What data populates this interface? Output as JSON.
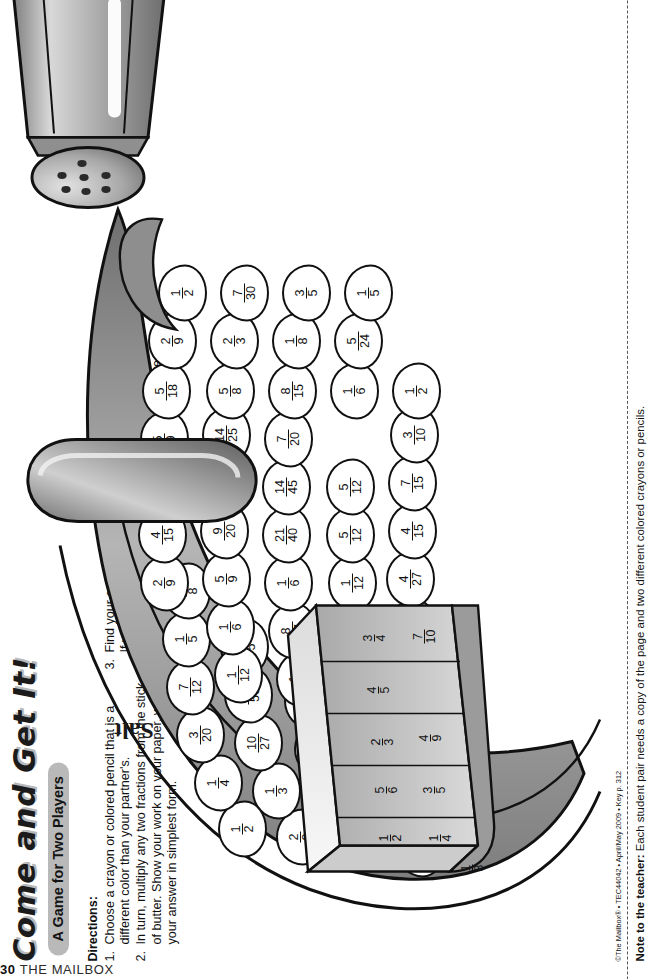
{
  "header": {
    "title": "Come and Get It!",
    "subtitle": "A Game for Two Players"
  },
  "directions": {
    "heading": "Directions:",
    "items": [
      {
        "num": "1.",
        "text": "Choose a crayon or colored pencil that is a different color than your partner's."
      },
      {
        "num": "2.",
        "text": "In turn, multiply any two fractions from the stick of butter. Show your work on your paper, writing your answer in simplest form."
      },
      {
        "num": "3.",
        "text": "Find your answer on the corn cob and color its kernel. If your answer is not on the corn cob or the kernel has already been colored, your turn is over."
      },
      {
        "num": "4.",
        "text": "Play for a set amount of time or until all kernels have been colored. The player with more colored kernels wins."
      }
    ]
  },
  "butter": {
    "label_icon": "butter-stick",
    "fractions": [
      "1/3",
      "1/4",
      "1/2",
      "3/5",
      "5/6",
      "2/3",
      "4/9",
      "4/5",
      "3/4",
      "7/10"
    ]
  },
  "salt": {
    "label": "Salt"
  },
  "corn": {
    "rows": [
      [
        "1/5",
        "3/20",
        "2/9",
        "1/2",
        "2/9",
        "4/15",
        "5/18",
        "2/9",
        "1/2"
      ],
      [
        "3/8",
        "7/12",
        "1/3",
        "1/4",
        "1/3",
        "16/45",
        "5/8",
        "2/3",
        "7/30"
      ],
      [
        "1/4",
        "1/9",
        "10/27",
        "3/20",
        "7/40",
        "1/12",
        "8/27",
        "5/9",
        "1/6"
      ],
      [
        "",
        "3/16",
        "21/50",
        "7/12",
        "2/5",
        "5/12",
        "1/12",
        "1/6",
        "3/5"
      ],
      [
        "",
        "",
        "2/5",
        "1/5",
        "4/27",
        "5/12",
        "21/40",
        "1/6",
        "1/8"
      ],
      [
        "",
        "",
        "",
        "3/8",
        "4/15",
        "7/15",
        "14/45",
        "9/20",
        "8/15"
      ],
      [
        "",
        "",
        "",
        "",
        "",
        "3/10",
        "7/20",
        "12/25",
        "1/6"
      ],
      [
        "",
        "",
        "",
        "",
        "",
        "",
        "",
        "14/25",
        "1/2"
      ],
      [
        "",
        "",
        "",
        "",
        "",
        "",
        "",
        "",
        "5/24"
      ],
      [
        "",
        "",
        "",
        "",
        "",
        "",
        "",
        "",
        "1/5"
      ]
    ],
    "kernel_values": [
      "1/5",
      "3/8",
      "1/4",
      "3/20",
      "7/12",
      "1/9",
      "3/16",
      "2/9",
      "1/3",
      "10/27",
      "21/50",
      "2/5",
      "1/2",
      "1/4",
      "3/20",
      "7/12",
      "1/5",
      "3/8",
      "2/9",
      "1/3",
      "7/40",
      "2/5",
      "4/27",
      "4/15",
      "4/15",
      "16/45",
      "1/12",
      "5/12",
      "5/12",
      "7/15",
      "3/10",
      "5/18",
      "5/8",
      "8/27",
      "1/12",
      "21/40",
      "14/45",
      "7/20",
      "2/9",
      "2/3",
      "5/9",
      "1/6",
      "1/6",
      "9/20",
      "12/25",
      "14/25",
      "1/2",
      "7/30",
      "1/6",
      "3/5",
      "1/8",
      "8/15",
      "1/6",
      "1/2",
      "5/24",
      "1/5",
      "3/5"
    ]
  },
  "footer": {
    "credit": "©The Mailbox® • TEC44042 • April/May 2009 • Key p. 312",
    "note_label": "Note to the teacher:",
    "note_text": " Each student pair needs a copy of the page and two different colored crayons or pencils.",
    "page_number": "30",
    "page_brand": "THE MAILBOX"
  },
  "colors": {
    "ink": "#111111",
    "husk_dark": "#8c8c8c",
    "husk_mid": "#b9b9b9",
    "husk_light": "#e6e6e6",
    "pill": "#b9b9b9"
  }
}
